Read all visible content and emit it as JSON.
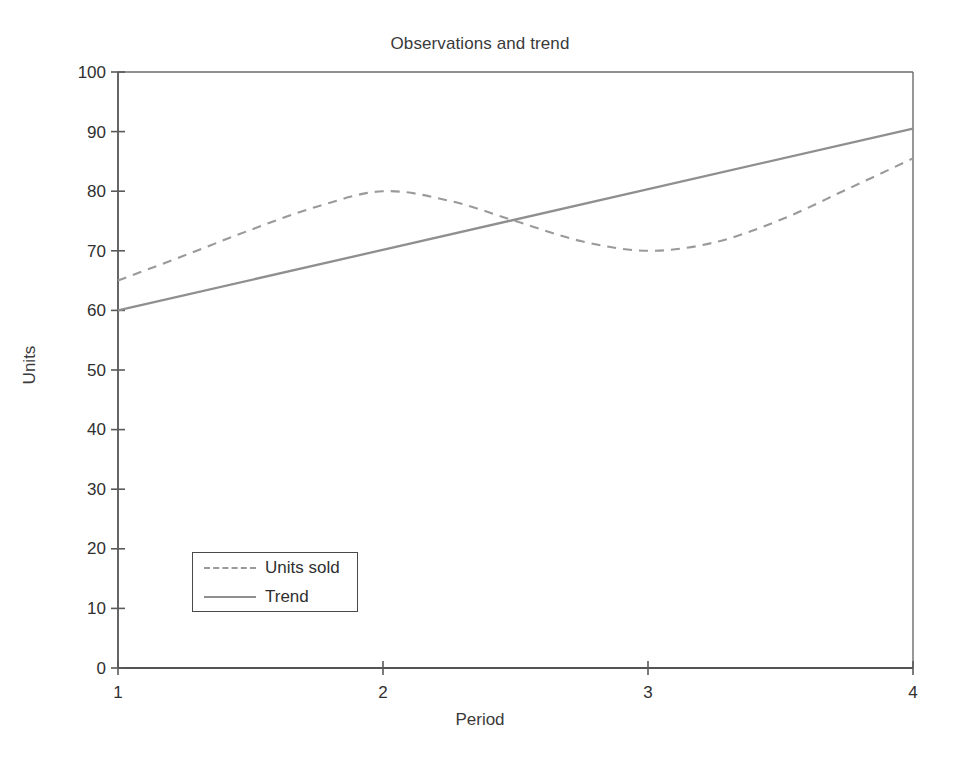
{
  "chart_data": {
    "type": "line",
    "title": "Observations and trend",
    "xlabel": "Period",
    "ylabel": "Units",
    "xlim": [
      1,
      4
    ],
    "ylim": [
      0,
      100
    ],
    "xticks": [
      "1",
      "2",
      "3",
      "4"
    ],
    "yticks": [
      "0",
      "10",
      "20",
      "30",
      "40",
      "50",
      "60",
      "70",
      "80",
      "90",
      "100"
    ],
    "grid": false,
    "legend_position": "lower left",
    "series": [
      {
        "name": "Units sold",
        "style": "dashed",
        "color": "#9a9a9a",
        "x": [
          1.0,
          1.25,
          1.5,
          1.75,
          2.0,
          2.25,
          2.5,
          2.75,
          3.0,
          3.25,
          3.5,
          3.75,
          4.0
        ],
        "values": [
          65.0,
          69.2,
          73.5,
          77.4,
          80.0,
          78.4,
          75.0,
          71.6,
          70.0,
          71.4,
          75.2,
          80.3,
          85.5
        ]
      },
      {
        "name": "Trend",
        "style": "solid",
        "color": "#8f8f8f",
        "x": [
          1.0,
          4.0
        ],
        "values": [
          60.0,
          90.5
        ]
      }
    ]
  },
  "legend": {
    "items": [
      {
        "label": "Units sold",
        "style": "dashed"
      },
      {
        "label": "Trend",
        "style": "solid"
      }
    ]
  },
  "axes": {
    "frame_color": "#6b6b6b",
    "tick_color": "#5a5a5a"
  }
}
